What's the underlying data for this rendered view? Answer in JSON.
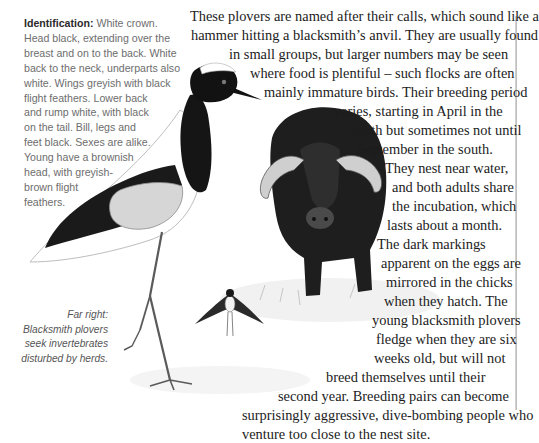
{
  "sidebar": {
    "label": "Identification:",
    "lines": [
      " White crown.",
      "Head black, extending over the",
      "breast and on to the back. White",
      "back to the neck, underparts also",
      "white. Wings greyish with black",
      "flight feathers. Lower back",
      "and rump white, with black",
      "on the tail. Bill, legs and",
      "feet black. Sexes are alike.",
      "Young have a brownish",
      "head, with greyish-",
      "brown flight",
      "feathers."
    ]
  },
  "caption": {
    "lines": [
      "Far right:",
      "Blacksmith plovers",
      "seek invertebrates",
      "disturbed by herds."
    ]
  },
  "body": {
    "lines": [
      "These plovers are named after their calls, which sound like a",
      "hammer hitting a blacksmith’s anvil. They are usually found",
      "in small groups, but larger numbers may be seen",
      "where food is plentiful – such flocks are often",
      "mainly immature birds. Their breeding period",
      "varies, starting in April in the",
      "north but sometimes not until",
      "September in the south.",
      "They nest near water,",
      "and both adults share",
      "the incubation, which",
      "lasts about a month.",
      "The dark markings",
      "apparent on the eggs are",
      "mirrored in the chicks",
      "when they hatch. The",
      "young blacksmith plovers",
      "fledge when they are six",
      "weeks old, but will not",
      "breed themselves until their",
      "second year. Breeding pairs can become",
      "surprisingly aggressive, dive-bombing people who",
      "venture too close to the nest site."
    ]
  },
  "illustrations": {
    "main": "blacksmith-plover",
    "secondary": "cape-buffalo",
    "small": "plover-in-flight"
  }
}
